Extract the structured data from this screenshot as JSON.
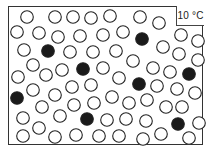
{
  "diagram": {
    "temperature_label": "10 °C",
    "particle_radius": 6.3,
    "colors": {
      "hollow_stroke": "#222222",
      "filled": "#1a1a1a",
      "frame": "#333333"
    },
    "particles": [
      {
        "x": 27,
        "y": 17,
        "filled": false
      },
      {
        "x": 55,
        "y": 17,
        "filled": false
      },
      {
        "x": 73,
        "y": 17,
        "filled": false
      },
      {
        "x": 91,
        "y": 18,
        "filled": false
      },
      {
        "x": 110,
        "y": 16,
        "filled": false
      },
      {
        "x": 140,
        "y": 17,
        "filled": false
      },
      {
        "x": 159,
        "y": 23,
        "filled": false
      },
      {
        "x": 17,
        "y": 32,
        "filled": false
      },
      {
        "x": 39,
        "y": 33,
        "filled": false
      },
      {
        "x": 58,
        "y": 37,
        "filled": false
      },
      {
        "x": 80,
        "y": 36,
        "filled": false
      },
      {
        "x": 103,
        "y": 35,
        "filled": false
      },
      {
        "x": 123,
        "y": 32,
        "filled": false
      },
      {
        "x": 142,
        "y": 39,
        "filled": true
      },
      {
        "x": 181,
        "y": 35,
        "filled": false
      },
      {
        "x": 198,
        "y": 41,
        "filled": false
      },
      {
        "x": 24,
        "y": 50,
        "filled": false
      },
      {
        "x": 48,
        "y": 51,
        "filled": true
      },
      {
        "x": 70,
        "y": 52,
        "filled": false
      },
      {
        "x": 93,
        "y": 52,
        "filled": false
      },
      {
        "x": 116,
        "y": 51,
        "filled": false
      },
      {
        "x": 163,
        "y": 47,
        "filled": false
      },
      {
        "x": 179,
        "y": 54,
        "filled": false
      },
      {
        "x": 198,
        "y": 60,
        "filled": false
      },
      {
        "x": 133,
        "y": 61,
        "filled": false
      },
      {
        "x": 33,
        "y": 65,
        "filled": false
      },
      {
        "x": 62,
        "y": 70,
        "filled": false
      },
      {
        "x": 83,
        "y": 69,
        "filled": true
      },
      {
        "x": 103,
        "y": 68,
        "filled": false
      },
      {
        "x": 153,
        "y": 68,
        "filled": false
      },
      {
        "x": 170,
        "y": 72,
        "filled": false
      },
      {
        "x": 189,
        "y": 74,
        "filled": true
      },
      {
        "x": 18,
        "y": 77,
        "filled": false
      },
      {
        "x": 46,
        "y": 75,
        "filled": false
      },
      {
        "x": 119,
        "y": 78,
        "filled": false
      },
      {
        "x": 139,
        "y": 84,
        "filled": true
      },
      {
        "x": 157,
        "y": 86,
        "filled": false
      },
      {
        "x": 177,
        "y": 89,
        "filled": false
      },
      {
        "x": 195,
        "y": 93,
        "filled": false
      },
      {
        "x": 33,
        "y": 90,
        "filled": false
      },
      {
        "x": 72,
        "y": 87,
        "filled": false
      },
      {
        "x": 91,
        "y": 85,
        "filled": false
      },
      {
        "x": 55,
        "y": 95,
        "filled": false
      },
      {
        "x": 17,
        "y": 98,
        "filled": true
      },
      {
        "x": 112,
        "y": 97,
        "filled": false
      },
      {
        "x": 129,
        "y": 103,
        "filled": false
      },
      {
        "x": 147,
        "y": 100,
        "filled": false
      },
      {
        "x": 166,
        "y": 107,
        "filled": false
      },
      {
        "x": 182,
        "y": 107,
        "filled": false
      },
      {
        "x": 42,
        "y": 107,
        "filled": false
      },
      {
        "x": 74,
        "y": 105,
        "filled": false
      },
      {
        "x": 94,
        "y": 103,
        "filled": false
      },
      {
        "x": 23,
        "y": 118,
        "filled": false
      },
      {
        "x": 60,
        "y": 116,
        "filled": false
      },
      {
        "x": 87,
        "y": 119,
        "filled": true
      },
      {
        "x": 107,
        "y": 120,
        "filled": false
      },
      {
        "x": 126,
        "y": 119,
        "filled": false
      },
      {
        "x": 146,
        "y": 121,
        "filled": false
      },
      {
        "x": 178,
        "y": 124,
        "filled": true
      },
      {
        "x": 199,
        "y": 123,
        "filled": false
      },
      {
        "x": 39,
        "y": 128,
        "filled": false
      },
      {
        "x": 23,
        "y": 136,
        "filled": false
      },
      {
        "x": 55,
        "y": 137,
        "filled": false
      },
      {
        "x": 76,
        "y": 135,
        "filled": false
      },
      {
        "x": 99,
        "y": 136,
        "filled": false
      },
      {
        "x": 119,
        "y": 136,
        "filled": false
      },
      {
        "x": 143,
        "y": 139,
        "filled": false
      },
      {
        "x": 161,
        "y": 134,
        "filled": false
      },
      {
        "x": 189,
        "y": 138,
        "filled": false
      }
    ]
  }
}
